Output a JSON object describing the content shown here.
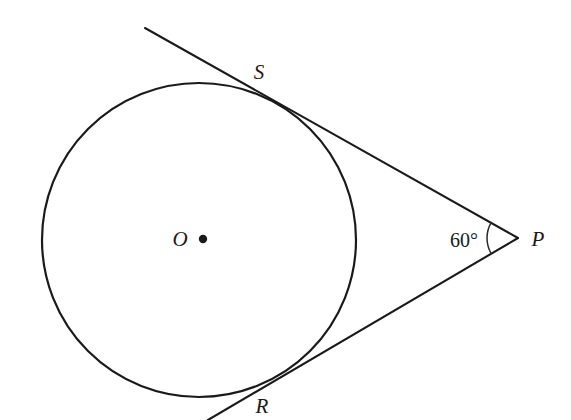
{
  "diagram": {
    "background_color": "#ffffff",
    "stroke_color": "#1a1a1a",
    "width": 571,
    "height": 420,
    "circle": {
      "center_x": 199,
      "center_y": 240,
      "radius": 157,
      "center_label": "O",
      "center_label_x": 180,
      "center_label_y": 239,
      "center_dot_x": 203,
      "center_dot_y": 239,
      "center_dot_radius": 4.2
    },
    "external_point": {
      "label": "P",
      "x": 518,
      "y": 238,
      "label_x": 538,
      "label_y": 239
    },
    "tangent_points": [
      {
        "label": "S",
        "x": 252,
        "y": 88,
        "label_x": 259,
        "label_y": 72
      },
      {
        "label": "R",
        "x": 250,
        "y": 390,
        "label_x": 262,
        "label_y": 406
      }
    ],
    "tangent_lines": [
      {
        "name": "upper-tangent-line",
        "from_x": 145,
        "from_y": 28,
        "to_x": 518,
        "to_y": 238
      },
      {
        "name": "lower-tangent-line",
        "from_x": 518,
        "from_y": 238,
        "to_x": 208,
        "to_y": 420
      }
    ],
    "angle": {
      "label": "60°",
      "value": 60,
      "unit": "degrees",
      "label_x": 464,
      "label_y": 240,
      "arc_radius": 31,
      "vertex_x": 518,
      "vertex_y": 238
    },
    "top_text_artifacts": [
      {
        "text": "·",
        "x": 116
      },
      {
        "text": "·",
        "x": 312
      },
      {
        "text": "·",
        "x": 138
      }
    ]
  }
}
